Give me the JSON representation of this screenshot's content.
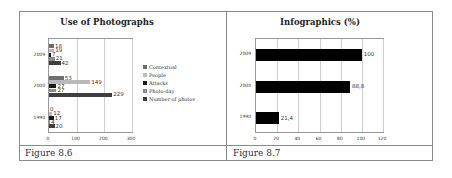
{
  "figures": [
    {
      "caption": "Figure 8.6"
    },
    {
      "caption": "Figure 8.7"
    }
  ],
  "chart_data": [
    {
      "type": "bar",
      "orientation": "horizontal",
      "title": "Use of Photographs",
      "categories": [
        "2009",
        "2000",
        "1990"
      ],
      "series": [
        {
          "name": "Contextual",
          "color": "#6e6e6e",
          "values": [
            18,
            53,
            0
          ]
        },
        {
          "name": "People",
          "color": "#b9b9b9",
          "values": [
            19,
            149,
            12
          ]
        },
        {
          "name": "Attacks",
          "color": "#1a1a1a",
          "values": [
            7,
            27,
            17
          ]
        },
        {
          "name": "Photo-day",
          "color": "#8c8c8c",
          "values": [
            21,
            27,
            4
          ]
        },
        {
          "name": "Number of photos",
          "color": "#3f3f3f",
          "values": [
            42,
            229,
            20
          ]
        }
      ],
      "xticks": [
        "0",
        "100",
        "200",
        "300"
      ],
      "xlim": [
        0,
        300
      ],
      "grid": true,
      "legend_position": "right"
    },
    {
      "type": "bar",
      "orientation": "horizontal",
      "title": "Infographics (%)",
      "categories": [
        "2009",
        "2000",
        "1990"
      ],
      "series": [
        {
          "name": "Infographics",
          "color": "#000000",
          "values": [
            100,
            88.8,
            21.4
          ]
        }
      ],
      "value_labels": [
        "100",
        "88,8",
        "21,4"
      ],
      "xticks": [
        "0",
        "20",
        "40",
        "60",
        "80",
        "100",
        "120"
      ],
      "xlim": [
        0,
        120
      ],
      "grid": true,
      "legend_position": "none"
    }
  ]
}
